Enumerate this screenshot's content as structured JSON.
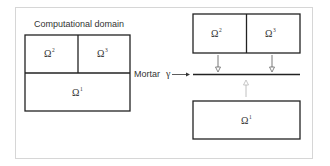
{
  "diagram": {
    "title": "Computational domain",
    "mortar_label": "Mortar",
    "mortar_symbol": "γ",
    "subdomains": {
      "omega1": {
        "symbol": "Ω",
        "index": "1"
      },
      "omega2": {
        "symbol": "Ω",
        "index": "2"
      },
      "omega3": {
        "symbol": "Ω",
        "index": "3"
      }
    },
    "colors": {
      "line": "#222222",
      "arrow": "#555555",
      "up_arrow": "#b0b0b0",
      "frame": "#d6d6d6"
    }
  }
}
